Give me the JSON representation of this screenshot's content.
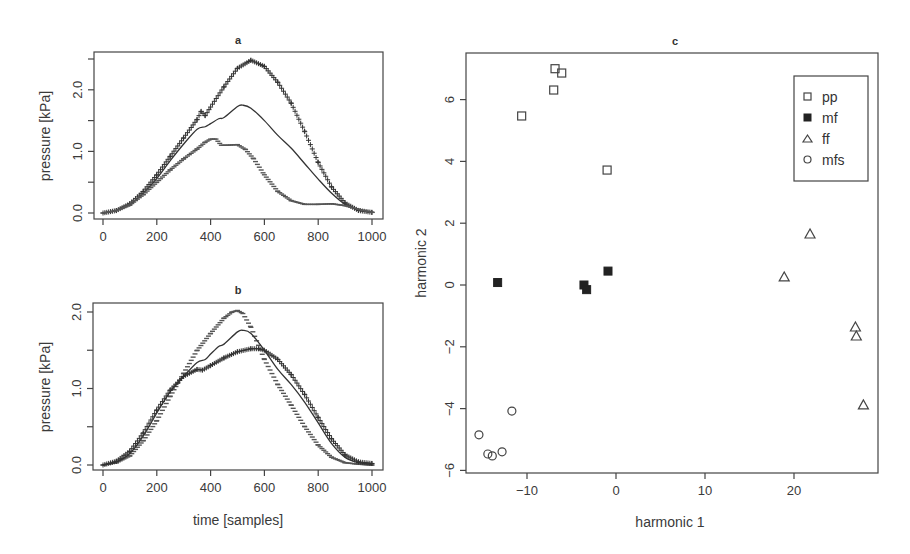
{
  "chart_data": [
    {
      "id": "a",
      "type": "line",
      "title": "a",
      "xlabel": "",
      "ylabel": "pressure [kPa]",
      "xlim": [
        0,
        1000
      ],
      "ylim": [
        0,
        2.5
      ],
      "xticks": [
        0,
        200,
        400,
        600,
        800,
        1000
      ],
      "yticks": [
        0.0,
        0.5,
        1.0,
        1.5,
        2.0,
        2.5
      ],
      "ytick_labels": [
        "0.0",
        "",
        "1.0",
        "",
        "2.0",
        ""
      ],
      "grid": false,
      "series": [
        {
          "name": "plus-marker curve",
          "style": "plus",
          "x": [
            0,
            50,
            100,
            150,
            200,
            250,
            300,
            350,
            365,
            380,
            400,
            450,
            500,
            550,
            600,
            650,
            700,
            750,
            800,
            850,
            900,
            950,
            1000
          ],
          "y": [
            0.0,
            0.04,
            0.15,
            0.35,
            0.62,
            0.92,
            1.22,
            1.52,
            1.65,
            1.58,
            1.72,
            2.05,
            2.35,
            2.48,
            2.38,
            2.12,
            1.78,
            1.32,
            0.82,
            0.42,
            0.16,
            0.04,
            0.01
          ]
        },
        {
          "name": "mean solid curve",
          "style": "solid",
          "x": [
            0,
            50,
            100,
            150,
            200,
            250,
            300,
            350,
            380,
            400,
            430,
            450,
            500,
            520,
            550,
            600,
            650,
            700,
            750,
            800,
            850,
            900,
            950,
            1000
          ],
          "y": [
            0.0,
            0.04,
            0.14,
            0.32,
            0.56,
            0.85,
            1.12,
            1.36,
            1.4,
            1.45,
            1.53,
            1.55,
            1.73,
            1.75,
            1.7,
            1.5,
            1.26,
            1.05,
            0.8,
            0.55,
            0.32,
            0.14,
            0.05,
            0.01
          ]
        },
        {
          "name": "dash-marker curve",
          "style": "dash",
          "x": [
            0,
            50,
            100,
            150,
            200,
            250,
            300,
            350,
            380,
            400,
            420,
            440,
            460,
            500,
            530,
            560,
            600,
            650,
            700,
            750,
            800,
            850,
            900,
            950,
            1000
          ],
          "y": [
            0.0,
            0.04,
            0.13,
            0.3,
            0.5,
            0.7,
            0.88,
            1.04,
            1.15,
            1.2,
            1.2,
            1.1,
            1.1,
            1.11,
            1.03,
            0.88,
            0.62,
            0.35,
            0.2,
            0.14,
            0.14,
            0.15,
            0.12,
            0.06,
            0.01
          ]
        }
      ]
    },
    {
      "id": "b",
      "type": "line",
      "title": "b",
      "xlabel": "time [samples]",
      "ylabel": "pressure [kPa]",
      "xlim": [
        0,
        1000
      ],
      "ylim": [
        0,
        2.0
      ],
      "xticks": [
        0,
        200,
        400,
        600,
        800,
        1000
      ],
      "yticks": [
        0.0,
        0.5,
        1.0,
        1.5,
        2.0
      ],
      "ytick_labels": [
        "0.0",
        "",
        "1.0",
        "",
        "2.0"
      ],
      "grid": false,
      "series": [
        {
          "name": "dash-marker curve",
          "style": "dash",
          "x": [
            0,
            50,
            100,
            150,
            200,
            250,
            300,
            350,
            400,
            450,
            480,
            500,
            520,
            550,
            600,
            650,
            700,
            750,
            800,
            850,
            900,
            950,
            1000
          ],
          "y": [
            0.0,
            0.03,
            0.12,
            0.32,
            0.58,
            0.9,
            1.2,
            1.5,
            1.72,
            1.92,
            2.0,
            2.02,
            1.98,
            1.8,
            1.38,
            1.05,
            0.78,
            0.5,
            0.26,
            0.1,
            0.03,
            0.01,
            0.0
          ]
        },
        {
          "name": "mean solid curve",
          "style": "solid",
          "x": [
            0,
            50,
            100,
            150,
            200,
            250,
            300,
            350,
            380,
            400,
            430,
            450,
            500,
            520,
            550,
            600,
            650,
            700,
            750,
            800,
            850,
            900,
            950,
            1000
          ],
          "y": [
            0.0,
            0.04,
            0.15,
            0.38,
            0.68,
            0.96,
            1.16,
            1.34,
            1.38,
            1.45,
            1.55,
            1.58,
            1.74,
            1.76,
            1.72,
            1.5,
            1.25,
            1.05,
            0.82,
            0.55,
            0.28,
            0.1,
            0.03,
            0.01
          ]
        },
        {
          "name": "plus-marker curve",
          "style": "plus",
          "x": [
            0,
            50,
            100,
            150,
            200,
            250,
            300,
            350,
            370,
            400,
            450,
            500,
            550,
            580,
            600,
            650,
            700,
            750,
            800,
            850,
            900,
            950,
            1000
          ],
          "y": [
            0.0,
            0.05,
            0.18,
            0.42,
            0.72,
            0.98,
            1.16,
            1.25,
            1.24,
            1.3,
            1.4,
            1.48,
            1.52,
            1.52,
            1.5,
            1.38,
            1.18,
            0.92,
            0.62,
            0.34,
            0.13,
            0.04,
            0.02
          ]
        }
      ]
    },
    {
      "id": "c",
      "type": "scatter",
      "title": "c",
      "xlabel": "harmonic 1",
      "ylabel": "harmonic 2",
      "xlim": [
        -16.5,
        29.5
      ],
      "ylim": [
        -6.1,
        7.6
      ],
      "xticks": [
        -10,
        0,
        10,
        20
      ],
      "yticks": [
        -6,
        -4,
        -2,
        0,
        2,
        4,
        6
      ],
      "grid": false,
      "legend_position": "top-right",
      "series": [
        {
          "name": "pp",
          "marker": "open-square",
          "x": [
            -6.85,
            -6.1,
            -7.0,
            -10.6,
            -1.0
          ],
          "y": [
            7.0,
            6.86,
            6.31,
            5.47,
            3.72
          ]
        },
        {
          "name": "mf",
          "marker": "filled-square",
          "x": [
            -13.3,
            -3.6,
            -3.3,
            -0.9
          ],
          "y": [
            0.08,
            0.0,
            -0.15,
            0.45
          ]
        },
        {
          "name": "ff",
          "marker": "open-triangle",
          "x": [
            21.8,
            18.9,
            26.9,
            27.0,
            27.8
          ],
          "y": [
            1.65,
            0.26,
            -1.36,
            -1.65,
            -3.88
          ]
        },
        {
          "name": "mfs",
          "marker": "open-circle",
          "x": [
            -11.7,
            -15.4,
            -14.4,
            -13.9,
            -12.8
          ],
          "y": [
            -4.08,
            -4.85,
            -5.47,
            -5.53,
            -5.4
          ]
        }
      ]
    }
  ],
  "labels": {
    "panel_a_title": "a",
    "panel_b_title": "b",
    "panel_c_title": "c",
    "ylabel_pressure": "pressure [kPa]",
    "xlabel_time": "time [samples]",
    "xlabel_h1": "harmonic 1",
    "ylabel_h2": "harmonic 2",
    "legend": [
      "pp",
      "mf",
      "ff",
      "mfs"
    ]
  },
  "colors": {
    "ink": "#333333",
    "frame": "#444444"
  }
}
